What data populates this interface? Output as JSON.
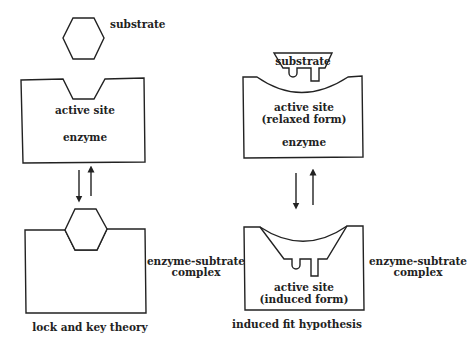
{
  "lock_and_key": {
    "substrate_label": "substrate",
    "active_site_label": "active site",
    "enzyme_label": "enzyme",
    "complex_label_line1": "enzyme-subtrate",
    "complex_label_line2": "complex",
    "caption": "lock and key theory"
  },
  "induced_fit": {
    "substrate_label": "substrate",
    "active_site_label": "active site",
    "relaxed_form_label": "(relaxed form)",
    "enzyme_label": "enzyme",
    "complex_label_line1": "enzyme-subtrate",
    "complex_label_line2": "complex",
    "induced_active_site_label": "active site",
    "induced_form_label": "(induced form)",
    "caption": "induced fit hypothesis"
  }
}
